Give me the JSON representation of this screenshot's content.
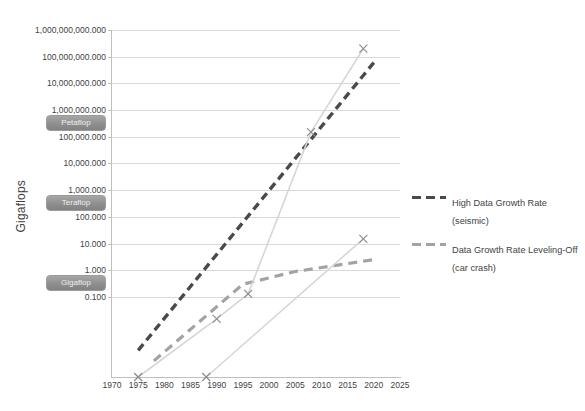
{
  "top_strip_text": "",
  "bottom_caption": "",
  "chart_data": {
    "type": "line",
    "title": "",
    "xlabel": "",
    "ylabel": "Gigaflops",
    "yscale": "log",
    "ylim": [
      0.1,
      1000000000000
    ],
    "xlim": [
      1970,
      2025
    ],
    "grid": true,
    "legend_position": "right",
    "y_tick_labels": [
      "1,000,000,000.000",
      "100,000,000.000",
      "10,000,000.000",
      "1,000,000.000",
      "100,000.000",
      "10,000.000",
      "1,000.000",
      "100.000",
      "10.000",
      "1.000",
      "0.100"
    ],
    "y_tick_values": [
      1000000000000,
      100000000000,
      10000000000,
      1000000000,
      100000000,
      10000000,
      1000000,
      100000,
      10000,
      1000,
      100
    ],
    "x_tick_labels": [
      "1970",
      "1975",
      "1980",
      "1985",
      "1990",
      "1995",
      "2000",
      "2005",
      "2010",
      "2015",
      "2020",
      "2025"
    ],
    "x_tick_values": [
      1970,
      1975,
      1980,
      1985,
      1990,
      1995,
      2000,
      2005,
      2010,
      2015,
      2020,
      2025
    ],
    "annotations": [
      {
        "name": "petaflop-badge",
        "label": "Petaflop",
        "y_value": 1000000000
      },
      {
        "name": "teraflop-badge",
        "label": "Teraflop",
        "y_value": 1000000
      },
      {
        "name": "gigaflop-badge",
        "label": "Gigaflop",
        "y_value": 1000
      }
    ],
    "series": [
      {
        "name": "High Data Growth Rate (seismic)",
        "style": "dashed",
        "color": "#4a4a4a",
        "marker": "none",
        "x": [
          1975,
          2020
        ],
        "y": [
          1.0,
          60000000000
        ]
      },
      {
        "name": "Data Growth Rate Leveling-Off (car crash)",
        "style": "dashed",
        "color": "#a3a3a3",
        "marker": "none",
        "x": [
          1978,
          1995,
          2005,
          2020
        ],
        "y": [
          0.4,
          300,
          900,
          2500
        ]
      },
      {
        "name": "Supercomputer performance (upper)",
        "style": "solid",
        "color": "#d6d6d6",
        "marker": "x",
        "x": [
          1975,
          1990,
          1996,
          2008,
          2018
        ],
        "y": [
          0.1,
          15,
          130,
          150000000,
          200000000000
        ]
      },
      {
        "name": "Supercomputer performance (lower)",
        "style": "solid",
        "color": "#d6d6d6",
        "marker": "x",
        "x": [
          1988,
          2018
        ],
        "y": [
          0.1,
          15000
        ]
      }
    ]
  },
  "legend": {
    "items": [
      {
        "label": "High Data Growth Rate (seismic)",
        "color": "#4a4a4a"
      },
      {
        "label": "Data Growth Rate Leveling-Off\n(car crash)",
        "color": "#a3a3a3"
      }
    ]
  }
}
